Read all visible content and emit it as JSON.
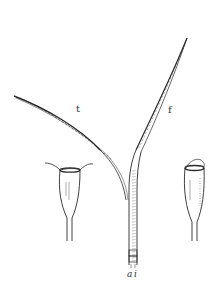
{
  "figure": {
    "type": "botanical line illustration",
    "labels": {
      "t": "t",
      "f": "f",
      "a": "a",
      "i": "i"
    },
    "ink_color": "#2a2a2a",
    "background_color": "#ffffff"
  }
}
